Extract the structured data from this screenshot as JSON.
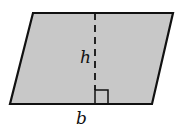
{
  "diagram": {
    "shape": "parallelogram",
    "fill_color": "#c8c8c8",
    "stroke_color": "#111111",
    "labels": {
      "height": "h",
      "base": "b"
    },
    "vertices": [
      [
        33,
        13
      ],
      [
        173,
        13
      ],
      [
        152,
        104
      ],
      [
        10,
        104
      ]
    ],
    "height_line": {
      "x": 95,
      "y1": 13,
      "y2": 104,
      "style": "dashed"
    },
    "right_angle_marker": {
      "x": 95,
      "y": 90,
      "size": 13
    }
  }
}
